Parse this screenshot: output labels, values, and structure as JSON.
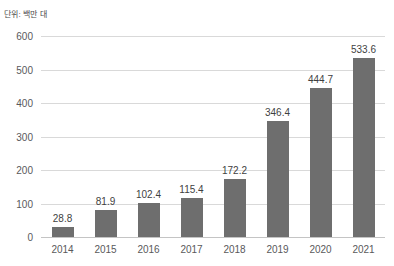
{
  "unit_caption": "단위: 백만 대",
  "colors": {
    "bar": "#6e6e6e",
    "gridline": "#d9d9d9",
    "axis": "#c4c4c4",
    "tick_text": "#59595b",
    "value_text": "#3f3f3f",
    "background": "#ffffff"
  },
  "chart_data": {
    "type": "bar",
    "title": "",
    "subtitle": "",
    "xlabel": "",
    "ylabel": "단위: 백만 대",
    "categories": [
      "2014",
      "2015",
      "2016",
      "2017",
      "2018",
      "2019",
      "2020",
      "2021"
    ],
    "values": [
      28.8,
      81.9,
      102.4,
      115.4,
      172.2,
      346.4,
      444.7,
      533.6
    ],
    "value_labels": [
      "28.8",
      "81.9",
      "102.4",
      "115.4",
      "172.2",
      "346.4",
      "444.7",
      "533.6"
    ],
    "ylim": [
      0,
      600
    ],
    "yticks": [
      0,
      100,
      200,
      300,
      400,
      500,
      600
    ],
    "ytick_labels": [
      "0",
      "100",
      "200",
      "300",
      "400",
      "500",
      "600"
    ],
    "grid": true,
    "grid_axis": "y",
    "legend": false,
    "legend_position": "none",
    "series": [
      {
        "name": "",
        "values": [
          28.8,
          81.9,
          102.4,
          115.4,
          172.2,
          346.4,
          444.7,
          533.6
        ]
      }
    ]
  }
}
